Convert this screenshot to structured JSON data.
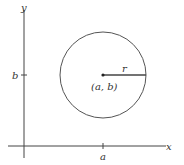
{
  "diagram": {
    "axes": {
      "x_label": "x",
      "y_label": "y"
    },
    "ticks": {
      "x_tick": "a",
      "y_tick": "b"
    },
    "circle": {
      "center_label": "(a, b)",
      "radius_label": "r",
      "stroke_color": "#555555"
    }
  }
}
